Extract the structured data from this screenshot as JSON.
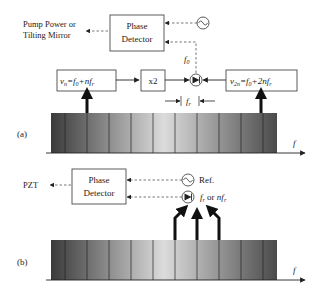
{
  "panel_a": {
    "label": "(a)",
    "output_label_line1": "Pump Power or",
    "output_label_line2": "Tilting Mirror",
    "phase_detector_line1": "Phase",
    "phase_detector_line2": "Detector",
    "f0_label": "f",
    "f0_sub": "0",
    "vn_box": {
      "v": "v",
      "sub": "n",
      "rest1": "=f",
      "sub0": "0",
      "rest2": "+nf",
      "subr": "r"
    },
    "x2_label": "x2",
    "v2n_box": {
      "v": "v",
      "sub": "2n",
      "rest1": "=f",
      "sub0": "0",
      "rest2": "+2nf",
      "subr": "r"
    },
    "fr_label": "f",
    "fr_sub": "r",
    "axis_label": "f"
  },
  "panel_b": {
    "label": "(b)",
    "output_label": "PZT",
    "phase_detector_line1": "Phase",
    "phase_detector_line2": "Detector",
    "ref_label": "Ref.",
    "beat_label": {
      "f": "f",
      "sub": "r",
      "or": " or ",
      "nf": "nf",
      "sub2": "r"
    },
    "axis_label": "f"
  },
  "colors": {
    "stroke": "#222222",
    "dashed": "#555555",
    "comb_dark": "#3a3a3a",
    "comb_light": "#d8d8d8"
  }
}
